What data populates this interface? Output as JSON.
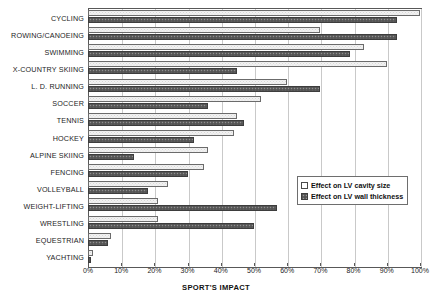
{
  "chart_data": {
    "type": "bar",
    "orientation": "horizontal",
    "title": "",
    "xlabel": "SPORT'S IMPACT",
    "ylabel": "",
    "xlim": [
      0,
      100
    ],
    "xtick_labels": [
      "0%",
      "10%",
      "20%",
      "30%",
      "40%",
      "50%",
      "60%",
      "70%",
      "80%",
      "90%",
      "100%"
    ],
    "xtick_values": [
      0,
      10,
      20,
      30,
      40,
      50,
      60,
      70,
      80,
      90,
      100
    ],
    "grid": true,
    "legend_position": "center-right",
    "categories": [
      "CYCLING",
      "ROWING/CANOEING",
      "SWIMMING",
      "X-COUNTRY SKIING",
      "L. D. RUNNING",
      "SOCCER",
      "TENNIS",
      "HOCKEY",
      "ALPINE SKIING",
      "FENCING",
      "VOLLEYBALL",
      "WEIGHT-LIFTING",
      "WRESTLING",
      "EQUESTRIAN",
      "YACHTING"
    ],
    "series": [
      {
        "name": "Effect on LV cavity size",
        "key": "cavity",
        "values": [
          100,
          70,
          83,
          90,
          60,
          52,
          45,
          44,
          36,
          35,
          24,
          21,
          21,
          7,
          1.5
        ]
      },
      {
        "name": "Effect on LV wall thickness",
        "key": "wall",
        "values": [
          93,
          93,
          79,
          45,
          70,
          36,
          47,
          32,
          14,
          30,
          18,
          57,
          50,
          6,
          1
        ]
      }
    ]
  },
  "legend": {
    "items": [
      {
        "label": "Effect on LV cavity size",
        "swatch": "open-square-swatch"
      },
      {
        "label": "Effect on LV wall thickness",
        "swatch": "filled-square-swatch"
      }
    ]
  },
  "colors": {
    "cavity_fill": "#f2f2f2",
    "cavity_border": "#6b6b6b",
    "wall_fill": "#5e5e5e",
    "wall_border": "#3d3d3d",
    "axis": "#585858",
    "grid": "#c9c9c9",
    "text": "#1a1a1a"
  }
}
